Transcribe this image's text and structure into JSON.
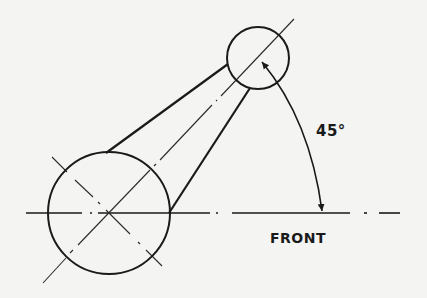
{
  "diagram": {
    "type": "technical-drawing",
    "colors": {
      "background": "#f4f4f2",
      "ink": "#1a1a1a",
      "centerline": "#2a2a2a"
    },
    "labels": {
      "angle": "45°",
      "reference": "FRONT"
    },
    "large_circle": {
      "cx": 109,
      "cy": 213,
      "r": 61
    },
    "small_circle": {
      "cx": 258,
      "cy": 58,
      "r": 31
    },
    "angle_degrees": 45
  }
}
